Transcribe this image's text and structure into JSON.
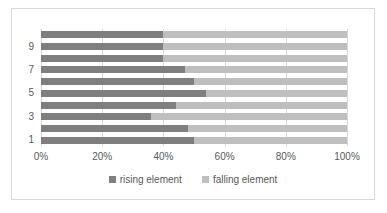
{
  "chart_data": {
    "type": "bar",
    "orientation": "horizontal",
    "stacked": true,
    "normalized": "percent",
    "title": "",
    "subtitle": "",
    "xlabel": "",
    "ylabel": "",
    "xlim": [
      0,
      100
    ],
    "xticks": [
      "0%",
      "20%",
      "40%",
      "60%",
      "80%",
      "100%"
    ],
    "xtick_values": [
      0,
      20,
      40,
      60,
      80,
      100
    ],
    "categories": [
      "1",
      "2",
      "3",
      "4",
      "5",
      "6",
      "7",
      "8",
      "9",
      "10"
    ],
    "ytick_labels": [
      "1",
      "3",
      "5",
      "7",
      "9"
    ],
    "grid": "vertical",
    "legend_position": "bottom",
    "series": [
      {
        "name": "rising element",
        "color": "#7f7f7f",
        "values": [
          50,
          48,
          36,
          44,
          54,
          50,
          47,
          40,
          40,
          40
        ]
      },
      {
        "name": "falling element",
        "color": "#bfbfbf",
        "values": [
          50,
          52,
          64,
          56,
          46,
          50,
          53,
          60,
          60,
          60
        ]
      }
    ]
  },
  "legend": {
    "items": [
      {
        "label": "rising element",
        "color": "#7f7f7f"
      },
      {
        "label": "falling element",
        "color": "#bfbfbf"
      }
    ]
  },
  "colors": {
    "rising": "#7f7f7f",
    "falling": "#bfbfbf",
    "gridline": "#d9d9d9",
    "border": "#d9d9d9",
    "text": "#595959",
    "background": "#ffffff"
  }
}
